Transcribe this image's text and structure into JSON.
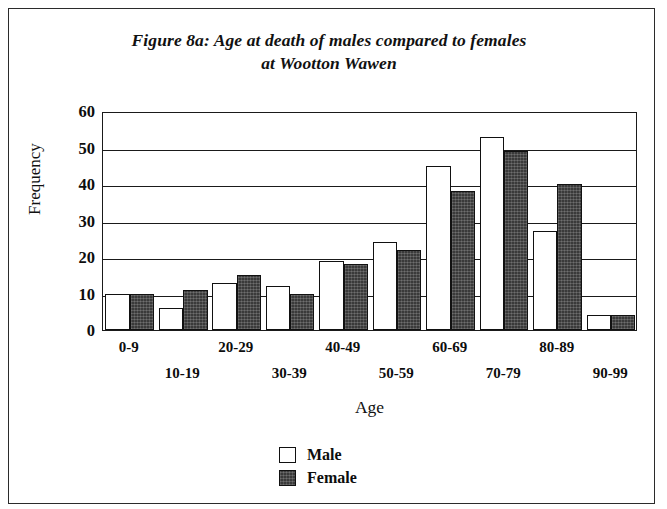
{
  "figure": {
    "title": "Figure 8a: Age at death of males compared to females at Wootton Wawen",
    "title_line1": "Figure 8a: Age at death of males compared to females",
    "title_line2": "at Wootton Wawen"
  },
  "legend": {
    "male_label": "Male",
    "female_label": "Female"
  },
  "axes": {
    "x_title": "Age",
    "y_title": "Frequency"
  },
  "colors": {
    "male_fill": "#ffffff",
    "female_fill": "#3a3a3a",
    "axis": "#1a1a1a",
    "text": "#0d0d0d",
    "frame": "#2b2b2b"
  },
  "chart_data": {
    "type": "bar",
    "title": "Figure 8a: Age at death of males compared to females at Wootton Wawen",
    "subtitle": "at Wootton Wawen",
    "xlabel": "Age",
    "ylabel": "Frequency",
    "ylim": [
      0,
      60
    ],
    "yticks": [
      0,
      10,
      20,
      30,
      40,
      50,
      60
    ],
    "ytick_labels": [
      "0",
      "10",
      "20",
      "30",
      "40",
      "50",
      "60"
    ],
    "grid": "horizontal",
    "legend_position": "bottom-center",
    "categories": [
      "0-9",
      "10-19",
      "20-29",
      "30-39",
      "40-49",
      "50-59",
      "60-69",
      "70-79",
      "80-89",
      "90-99"
    ],
    "series": [
      {
        "name": "Male",
        "values": [
          10,
          6,
          13,
          12,
          19,
          24,
          45,
          53,
          27,
          4
        ]
      },
      {
        "name": "Female",
        "values": [
          10,
          11,
          15,
          10,
          18,
          22,
          38,
          49,
          40,
          4
        ]
      }
    ]
  }
}
